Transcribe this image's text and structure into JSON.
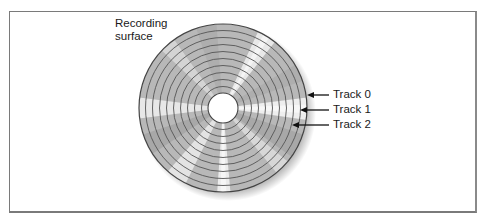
{
  "figure": {
    "title_label_line1": "Recording",
    "title_label_line2": "surface",
    "tracks": [
      {
        "label": "Track 0",
        "arrow_y": 95,
        "arrow_tip_x": 307
      },
      {
        "label": "Track 1",
        "arrow_y": 110,
        "arrow_tip_x": 300
      },
      {
        "label": "Track 2",
        "arrow_y": 125,
        "arrow_tip_x": 292
      }
    ],
    "disk": {
      "cx": 223,
      "cy": 108,
      "radius": 84,
      "hub_radius": 15,
      "ring_count": 10
    },
    "colors": {
      "frame": "#7a7a7a",
      "ring": "#555555",
      "text": "#1a1a1a",
      "arrow": "#111111"
    }
  }
}
